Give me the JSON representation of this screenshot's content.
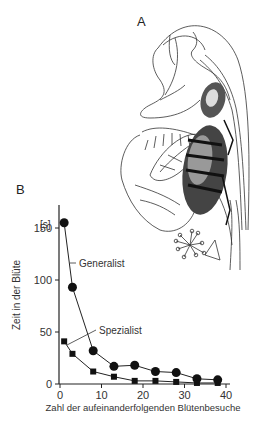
{
  "panels": {
    "a_label": "A",
    "b_label": "B"
  },
  "illustration": {
    "subject": "bee-in-flower",
    "description": "Line drawing of a bumblebee inside a lipped flower"
  },
  "chart_data": {
    "type": "line",
    "title": "",
    "xlabel": "Zahl der aufeinanderfolgenden Blütenbesuche",
    "ylabel": "Zeit in der Blüte",
    "yunit": "[s]",
    "xlim": [
      0,
      40
    ],
    "ylim": [
      0,
      170
    ],
    "xticks": [
      0,
      10,
      20,
      30,
      40
    ],
    "yticks": [
      0,
      50,
      100,
      150
    ],
    "grid": false,
    "legend": "inline-annotations",
    "series": [
      {
        "name": "Generalist",
        "marker": "circle",
        "x": [
          1,
          3,
          8,
          13,
          18,
          23,
          28,
          33,
          38
        ],
        "values": [
          155,
          93,
          32,
          17,
          18,
          12,
          11,
          5,
          4
        ]
      },
      {
        "name": "Spezialist",
        "marker": "square",
        "x": [
          1,
          3,
          8,
          13,
          18,
          23,
          28,
          33,
          38
        ],
        "values": [
          41,
          29,
          12,
          7,
          3,
          3,
          2,
          1,
          1
        ]
      }
    ]
  }
}
